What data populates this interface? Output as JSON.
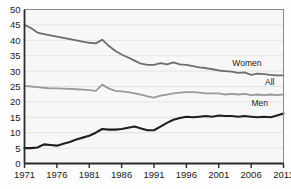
{
  "chart_data": {
    "type": "line",
    "title": "",
    "subtitle": "",
    "xlabel": "",
    "ylabel": "",
    "xlim": [
      1971,
      2011
    ],
    "ylim": [
      0,
      50
    ],
    "grid": true,
    "legend_position": "inline-right",
    "x": [
      1971,
      1972,
      1973,
      1974,
      1975,
      1976,
      1977,
      1978,
      1979,
      1980,
      1981,
      1982,
      1983,
      1984,
      1985,
      1986,
      1987,
      1988,
      1989,
      1990,
      1991,
      1992,
      1993,
      1994,
      1995,
      1996,
      1997,
      1998,
      1999,
      2000,
      2001,
      2002,
      2003,
      2004,
      2005,
      2006,
      2007,
      2008,
      2009,
      2010,
      2011
    ],
    "xticks": [
      1971,
      1976,
      1981,
      1986,
      1991,
      1996,
      2001,
      2006,
      2011
    ],
    "xtick_labels": [
      "1971",
      "1976",
      "1981",
      "1986",
      "1991",
      "1996",
      "2001",
      "2006",
      "2011"
    ],
    "yticks": [
      0,
      5,
      10,
      15,
      20,
      25,
      30,
      35,
      40,
      45,
      50
    ],
    "ytick_labels": [
      "0",
      "5",
      "10",
      "15",
      "20",
      "25",
      "30",
      "35",
      "40",
      "45",
      "50"
    ],
    "series": [
      {
        "name": "Women",
        "label": "Women",
        "color": "#6d6d6d",
        "width": 1.8,
        "values": [
          45.0,
          44.0,
          42.5,
          42.0,
          41.6,
          41.2,
          40.8,
          40.4,
          40.0,
          39.6,
          39.2,
          39.0,
          40.2,
          38.2,
          36.6,
          35.4,
          34.4,
          33.4,
          32.4,
          32.0,
          32.0,
          32.6,
          32.2,
          32.8,
          32.2,
          32.0,
          31.6,
          31.2,
          31.0,
          30.6,
          30.2,
          30.0,
          29.8,
          29.4,
          29.6,
          28.8,
          29.2,
          29.0,
          28.8,
          28.6,
          28.6
        ]
      },
      {
        "name": "All",
        "label": "All",
        "color": "#9a9a9a",
        "width": 1.8,
        "values": [
          25.2,
          25.0,
          24.8,
          24.6,
          24.4,
          24.4,
          24.3,
          24.2,
          24.1,
          24.0,
          23.8,
          23.6,
          25.6,
          24.4,
          23.6,
          23.4,
          23.2,
          22.8,
          22.4,
          21.8,
          21.4,
          22.0,
          22.4,
          22.8,
          23.0,
          23.2,
          23.2,
          23.0,
          22.8,
          22.8,
          22.8,
          22.4,
          22.6,
          22.4,
          22.6,
          22.2,
          22.4,
          22.2,
          22.4,
          22.2,
          22.4
        ]
      },
      {
        "name": "Men",
        "label": "Men",
        "color": "#1f1f1f",
        "width": 2.1,
        "values": [
          5.0,
          5.0,
          5.2,
          6.2,
          6.0,
          5.8,
          6.4,
          7.0,
          7.8,
          8.4,
          9.0,
          10.0,
          11.2,
          11.0,
          11.0,
          11.2,
          11.6,
          12.0,
          11.4,
          10.8,
          10.8,
          12.0,
          13.2,
          14.2,
          14.8,
          15.2,
          15.0,
          15.2,
          15.4,
          15.2,
          15.6,
          15.4,
          15.4,
          15.2,
          15.4,
          15.2,
          15.0,
          15.2,
          15.0,
          15.6,
          16.2
        ]
      }
    ],
    "series_label_positions": [
      {
        "name": "Women",
        "x": 2007.6,
        "y": 31.6
      },
      {
        "name": "All",
        "x": 2009.6,
        "y": 25.4
      },
      {
        "name": "Men",
        "x": 2008.6,
        "y": 18.8
      }
    ]
  },
  "figure": {
    "background_color": "#fdfdfd",
    "plot_background_color": "#f7f7f7",
    "grid_color": "#e3e3e3",
    "axis_color": "#2b2b2b"
  }
}
